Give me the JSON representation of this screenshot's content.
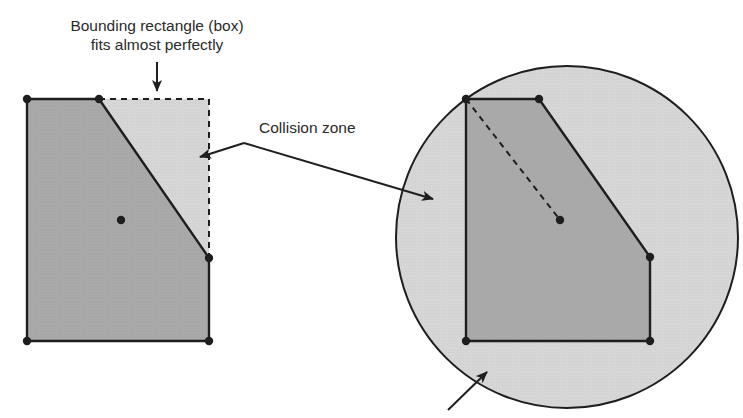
{
  "labels": {
    "box_line1": "Bounding rectangle (box)",
    "box_line2": "fits almost perfectly",
    "collision_zone": "Collision zone"
  },
  "colors": {
    "polygon_fill": "#a9a9a9",
    "collision_fill": "#d6d6d6",
    "stroke": "#1e1e1e",
    "text": "#2a2a2a",
    "background": "#ffffff"
  },
  "left_figure": {
    "polygon_points": [
      [
        27,
        99
      ],
      [
        99,
        99
      ],
      [
        209,
        258
      ],
      [
        209,
        341
      ],
      [
        27,
        341
      ]
    ],
    "bounding_box": {
      "x": 27,
      "y": 99,
      "w": 182,
      "h": 242
    },
    "center": [
      121,
      220
    ]
  },
  "right_figure": {
    "circle": {
      "cx": 567,
      "cy": 237,
      "r": 171
    },
    "polygon_points": [
      [
        466,
        99
      ],
      [
        539,
        99
      ],
      [
        650,
        257
      ],
      [
        650,
        341
      ],
      [
        466,
        341
      ]
    ],
    "center": [
      560,
      220
    ],
    "radius_line": [
      [
        466,
        99
      ],
      [
        560,
        220
      ]
    ]
  }
}
